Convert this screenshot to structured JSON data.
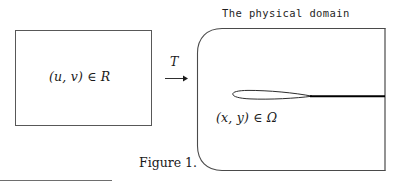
{
  "figure": {
    "caption": "Figure 1.",
    "domain_title": "The physical domain",
    "computational_label": "(u, v) ∈ R",
    "physical_label": "(x, y) ∈ Ω",
    "map_label": "T",
    "arrow_icon": "right-arrow-icon",
    "colors": {
      "background": "#ffffff",
      "stroke": "#3b3b3b",
      "airfoil_stroke": "#1a1a1a",
      "wake_stroke": "#000000",
      "rule": "#6e6e6e",
      "text": "#1a1a1a"
    },
    "geometry": {
      "computational_rect": {
        "x": 15,
        "y": 30,
        "width": 137,
        "height": 96
      },
      "physical_domain": {
        "x": 196,
        "y": 28,
        "width": 189,
        "height": 143,
        "corner_radius": 26,
        "open_side": "right"
      },
      "airfoil": {
        "leading_edge_x": 233,
        "trailing_edge_x": 312,
        "chord_y": 96
      },
      "wake": {
        "start_x": 312,
        "end_x": 385,
        "y": 96
      },
      "arrow": {
        "x1": 165,
        "x2": 186,
        "y": 78
      },
      "bottom_rule": {
        "x1": 0,
        "x2": 112,
        "y": 180
      }
    }
  }
}
